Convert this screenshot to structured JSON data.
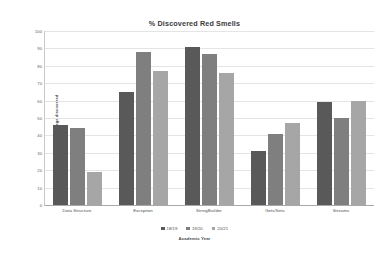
{
  "chart_data": {
    "type": "bar",
    "title": "% Discovered Red Smells",
    "xlabel": "Academic Year",
    "ylabel": "Percentage discovered",
    "ylim": [
      0,
      100
    ],
    "yticks": [
      0,
      10,
      20,
      30,
      40,
      50,
      60,
      70,
      80,
      90,
      100
    ],
    "grid": true,
    "legend_position": "bottom",
    "categories": [
      "Data Structure",
      "Exception",
      "StringBuilder",
      "Gets/Sets",
      "Streams"
    ],
    "series": [
      {
        "name": "18/19",
        "color": "#595959",
        "values": [
          46,
          65,
          91,
          31,
          59
        ]
      },
      {
        "name": "19/20",
        "color": "#7f7f7f",
        "values": [
          44,
          88,
          87,
          41,
          50
        ]
      },
      {
        "name": "20/21",
        "color": "#a6a6a6",
        "values": [
          19,
          77,
          76,
          47,
          60
        ]
      }
    ]
  },
  "chart": {
    "title": "% Discovered Red Smells",
    "y_axis_title": "Percentage discovered",
    "x_axis_title": "Academic Year",
    "y_ticks": [
      "100",
      "90",
      "80",
      "70",
      "60",
      "50",
      "40",
      "30",
      "20",
      "10",
      "0"
    ],
    "x_labels": [
      "Data Structure",
      "Exception",
      "StringBuilder",
      "Gets/Sets",
      "Streams"
    ],
    "legend": [
      {
        "label": "18/19",
        "color": "#595959"
      },
      {
        "label": "19/20",
        "color": "#7f7f7f"
      },
      {
        "label": "20/21",
        "color": "#a6a6a6"
      }
    ]
  }
}
